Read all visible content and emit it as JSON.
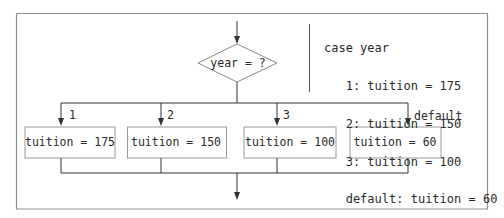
{
  "diagram": {
    "decision": {
      "label": "year = ?"
    },
    "branches": [
      {
        "label": "1",
        "action": "tuition = 175"
      },
      {
        "label": "2",
        "action": "tuition = 150"
      },
      {
        "label": "3",
        "action": "tuition = 100"
      },
      {
        "label": "default",
        "action": "tuition = 60"
      }
    ],
    "pseudocode": {
      "lines": [
        "case year",
        "   1: tuition = 175",
        "   2: tuition = 150",
        "   3: tuition = 100",
        "   default: tuition = 60",
        "endcase"
      ]
    },
    "colors": {
      "line": "#3a3a3a",
      "box_border": "#9a9a9a",
      "frame": "#8a8a8a",
      "text": "#2b2b2b"
    }
  }
}
